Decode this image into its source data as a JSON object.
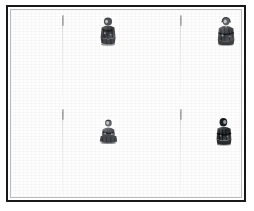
{
  "page": {
    "title": "Scanned illustrated plate",
    "description": "White printed page inside a dark rectangular frame, with two faint vertical column rules and four small grayscale engraved figures arranged in two rows.",
    "background_color": "#ffffff",
    "paper_color": "#fefefe"
  },
  "frame": {
    "name": "plate-border",
    "border_color": "#16181a",
    "inner_rule_color": "#b9bcbe",
    "left": 6,
    "top": 5,
    "width": 240,
    "height": 197,
    "border_width_px": 2.4
  },
  "column_rules": [
    {
      "label": "left-column-rule",
      "x": 62,
      "color": "#8c8f92",
      "segments": [
        {
          "top": 10,
          "height": 86
        },
        {
          "top": 104,
          "height": 86
        }
      ],
      "ticks": [
        {
          "top": 10
        },
        {
          "top": 104
        }
      ]
    },
    {
      "label": "right-column-rule",
      "x": 180,
      "color": "#8c8f92",
      "segments": [
        {
          "top": 10,
          "height": 86
        },
        {
          "top": 104,
          "height": 86
        }
      ],
      "ticks": [
        {
          "top": 10
        },
        {
          "top": 104
        }
      ]
    }
  ],
  "figures": [
    {
      "label": "figure-top-left",
      "caption": "standing robed figure",
      "ink_color": "#4a4c4f",
      "left": 97,
      "top": 11,
      "width": 22,
      "height": 30,
      "pose": "standing"
    },
    {
      "label": "figure-top-right",
      "caption": "standing robed figure",
      "ink_color": "#4a4c4f",
      "left": 215,
      "top": 11,
      "width": 22,
      "height": 30,
      "pose": "standing"
    },
    {
      "label": "figure-bottom-left",
      "caption": "seated figure",
      "ink_color": "#55575a",
      "left": 98,
      "top": 113,
      "width": 21,
      "height": 27,
      "pose": "seated"
    },
    {
      "label": "figure-bottom-right",
      "caption": "standing robed figure",
      "ink_color": "#3f4144",
      "left": 214,
      "top": 112,
      "width": 20,
      "height": 29,
      "pose": "standing"
    }
  ]
}
